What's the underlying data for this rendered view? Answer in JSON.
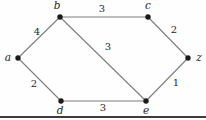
{
  "diagram": {
    "type": "weighted-graph",
    "background": "#fefefe",
    "edge_color": "#7d7d7d",
    "edge_width": 1.1,
    "node_color": "#1a1a1a",
    "node_radius": 2.7,
    "label_color": "#1f1f1f",
    "label_font_size": 10.5,
    "weight_font_size": 10,
    "rule_color": "#3c3c3c",
    "rule_y": 117,
    "rule_thickness": 2,
    "nodes": [
      {
        "id": "a",
        "label": "a",
        "x": 18,
        "y": 58,
        "lx": 8,
        "ly": 61
      },
      {
        "id": "b",
        "label": "b",
        "x": 60,
        "y": 17,
        "lx": 57,
        "ly": 9
      },
      {
        "id": "c",
        "label": "c",
        "x": 148,
        "y": 17,
        "lx": 148,
        "ly": 9
      },
      {
        "id": "d",
        "label": "d",
        "x": 61,
        "y": 101,
        "lx": 60,
        "ly": 114
      },
      {
        "id": "e",
        "label": "e",
        "x": 146,
        "y": 101,
        "lx": 146,
        "ly": 114
      },
      {
        "id": "z",
        "label": "z",
        "x": 188,
        "y": 58,
        "lx": 199,
        "ly": 61
      }
    ],
    "edges": [
      {
        "from": "a",
        "to": "b",
        "weight": "4",
        "wx": 37,
        "wy": 35
      },
      {
        "from": "b",
        "to": "c",
        "weight": "3",
        "wx": 102,
        "wy": 12
      },
      {
        "from": "c",
        "to": "z",
        "weight": "2",
        "wx": 174,
        "wy": 33
      },
      {
        "from": "a",
        "to": "d",
        "weight": "2",
        "wx": 34,
        "wy": 87
      },
      {
        "from": "d",
        "to": "e",
        "weight": "3",
        "wx": 103,
        "wy": 111
      },
      {
        "from": "e",
        "to": "z",
        "weight": "1",
        "wx": 176,
        "wy": 86
      },
      {
        "from": "b",
        "to": "e",
        "weight": "3",
        "wx": 108,
        "wy": 50
      }
    ]
  }
}
